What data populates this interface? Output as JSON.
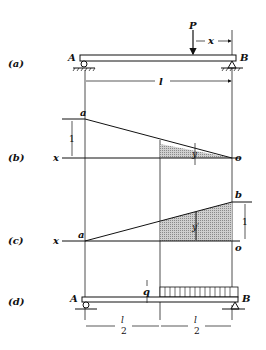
{
  "figure": {
    "panels": [
      {
        "id": "a",
        "label": "(a)",
        "description": "Simply supported beam AB of span l with point load P at distance x from B"
      },
      {
        "id": "b",
        "label": "(b)",
        "description": "Influence line for reaction at A"
      },
      {
        "id": "c",
        "label": "(c)",
        "description": "Influence line for reaction at B"
      },
      {
        "id": "d",
        "label": "(d)",
        "description": "Beam AB with uniform load q on right half"
      }
    ],
    "labels": {
      "A": "A",
      "B": "B",
      "P": "P",
      "x": "x",
      "l": "l",
      "a": "a",
      "b": "b",
      "o": "o",
      "one": "1",
      "y": "y",
      "y_prime": "y′",
      "q": "q",
      "half_num": "l",
      "half_den": "2"
    }
  }
}
